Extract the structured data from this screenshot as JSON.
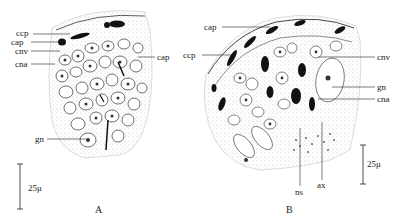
{
  "figure": {
    "panels": [
      {
        "id": "A",
        "label": "A",
        "annotations": {
          "ccp": "ccp",
          "cap_left": "cap",
          "cnv": "cnv",
          "cna": "cna",
          "cap_right": "cap",
          "gn": "gn"
        },
        "scale_bar": "25μ"
      },
      {
        "id": "B",
        "label": "B",
        "annotations": {
          "cap": "cap",
          "ccp": "ccp",
          "cnv": "cnv",
          "gn": "gn",
          "cna": "cna",
          "ns": "ns",
          "ax": "ax"
        },
        "scale_bar": "25μ"
      }
    ],
    "colors": {
      "ink": "#222222",
      "stipple": "#9a9a9a",
      "background": "#ffffff"
    }
  }
}
